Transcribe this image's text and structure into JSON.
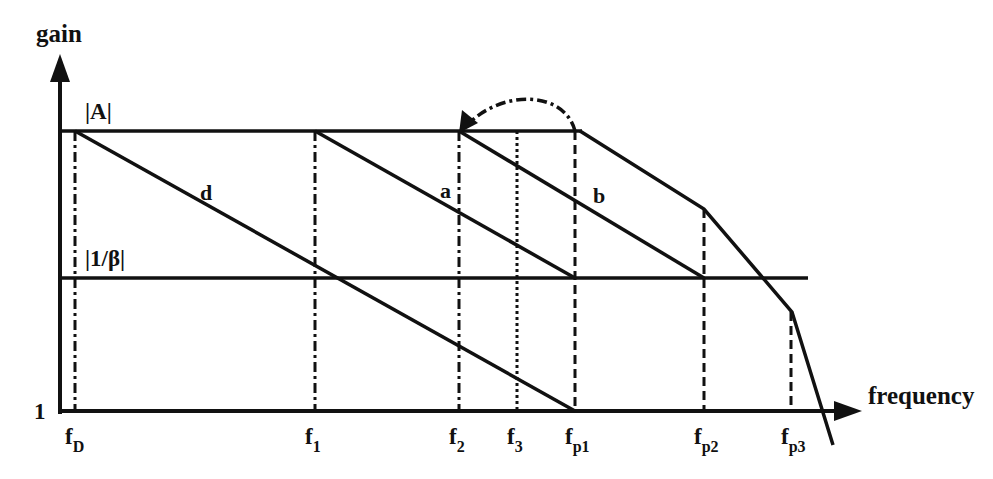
{
  "chart_data": {
    "type": "line",
    "title": "",
    "xlabel": "frequency",
    "ylabel": "gain",
    "y_origin_label": "1",
    "scale": "log-log (asymptotic Bode magnitude plot)",
    "levels": [
      {
        "name": "open-loop gain",
        "label": "|A|"
      },
      {
        "name": "feedback level",
        "label": "|1/β|"
      }
    ],
    "x_ticks": [
      {
        "main": "f",
        "sub": "D",
        "id": "fD",
        "style": "dashdot"
      },
      {
        "main": "f",
        "sub": "1",
        "id": "f1",
        "style": "dashdot"
      },
      {
        "main": "f",
        "sub": "2",
        "id": "f2",
        "style": "dashdot"
      },
      {
        "main": "f",
        "sub": "3",
        "id": "f3",
        "style": "dotted"
      },
      {
        "main": "f",
        "sub": "p1",
        "id": "fp1",
        "style": "dashed"
      },
      {
        "main": "f",
        "sub": "p2",
        "id": "fp2",
        "style": "dashed"
      },
      {
        "main": "f",
        "sub": "p3",
        "id": "fp3",
        "style": "dashed"
      }
    ],
    "series": [
      {
        "name": "d",
        "label": "d",
        "description": "dominant-pole compensation: -20 dB/dec from |A| at fD down to unity gain at fp1",
        "points": [
          [
            "fD",
            "|A|"
          ],
          [
            "fp1",
            "1"
          ]
        ]
      },
      {
        "name": "a",
        "label": "a",
        "description": "-20 dB/dec from |A| at f1 to |1/β| at fp1",
        "points": [
          [
            "f1",
            "|A|"
          ],
          [
            "fp1",
            "|1/β|"
          ]
        ]
      },
      {
        "name": "b",
        "label": "b",
        "description": "-20 dB/dec from |A| at f2 to |1/β| at fp2",
        "points": [
          [
            "f2",
            "|A|"
          ],
          [
            "fp2",
            "|1/β|"
          ]
        ]
      },
      {
        "name": "uncompensated",
        "label": "",
        "description": "original response with poles at fp1, fp2, fp3",
        "points": [
          [
            "fp1",
            "|A|"
          ],
          [
            "fp2",
            "between"
          ],
          [
            "fp3",
            "below |1/β|"
          ],
          [
            "beyond",
            "below 1"
          ]
        ]
      }
    ],
    "annotations": [
      {
        "type": "curved-arrow",
        "style": "dashdot",
        "from": "fp1",
        "to": "f2",
        "description": "pole moved from fp1 down to f2 (pole splitting)"
      }
    ]
  }
}
